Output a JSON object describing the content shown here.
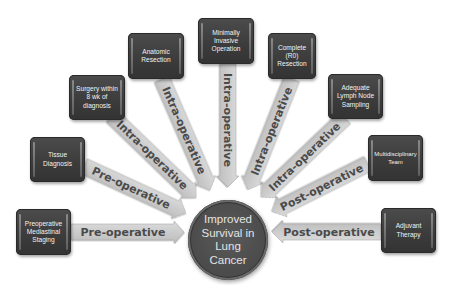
{
  "diagram": {
    "center": {
      "label": "Improved\nSurvival in\nLung\nCancer"
    },
    "colors": {
      "box_fill": "#3f3f3f",
      "box_text": "#f2f2f2",
      "arrow_fill": "#cfcfcf",
      "arrow_text": "#4a4a4a",
      "center_fill": "#4d4d4d",
      "center_text": "#e4e4e4"
    },
    "nodes": [
      {
        "id": "preoperative-mediastinal-staging",
        "label": "Preoperative\nMediastinal\nStaging",
        "arrow_label": "Pre-operative",
        "phase": "Pre-operative"
      },
      {
        "id": "tissue-diagnosis",
        "label": "Tissue\nDiagnosis",
        "arrow_label": "Pre-operative",
        "phase": "Pre-operative"
      },
      {
        "id": "surgery-within-8-wk",
        "label": "Surgery within\n8 wk of\ndiagnosis",
        "arrow_label": "Intra-operative",
        "phase": "Intra-operative"
      },
      {
        "id": "anatomic-resection",
        "label": "Anatomic\nResection",
        "arrow_label": "Intra-operative",
        "phase": "Intra-operative"
      },
      {
        "id": "minimally-invasive-operation",
        "label": "Minimally\nInvasive\nOperation",
        "arrow_label": "Intra-operative",
        "phase": "Intra-operative"
      },
      {
        "id": "complete-r0-resection",
        "label": "Complete (R0)\nResection",
        "arrow_label": "Intra-operative",
        "phase": "Intra-operative"
      },
      {
        "id": "adequate-lymph-node-sampling",
        "label": "Adequate\nLymph Node\nSampling",
        "arrow_label": "Intra-operative",
        "phase": "Intra-operative"
      },
      {
        "id": "multidisciplinary-team",
        "label": "Multidisciplinary\nTeam",
        "arrow_label": "Post-operative",
        "phase": "Post-operative"
      },
      {
        "id": "adjuvant-therapy",
        "label": "Adjuvant\nTherapy",
        "arrow_label": "Post-operative",
        "phase": "Post-operative"
      }
    ]
  }
}
